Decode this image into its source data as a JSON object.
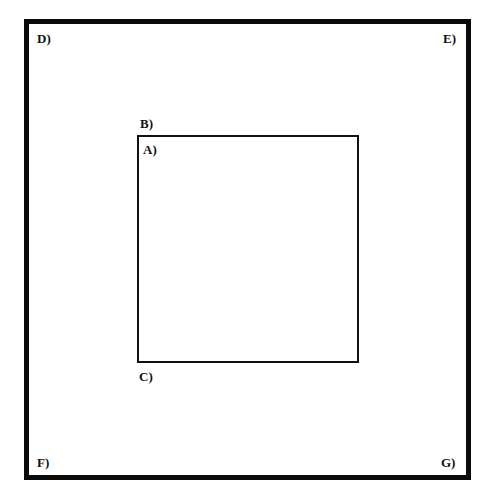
{
  "diagram": {
    "type": "nested-rectangles",
    "outer_box": {
      "corner_labels": {
        "top_left": "D)",
        "top_right": "E)",
        "bottom_left": "F)",
        "bottom_right": "G)"
      }
    },
    "inner_box": {
      "labels": {
        "above_top_left": "B)",
        "inside_top_left": "A)",
        "below_bottom_left": "C)"
      }
    },
    "colors": {
      "stroke": "#0a0a0a",
      "background": "#ffffff",
      "text": "#111111"
    }
  }
}
